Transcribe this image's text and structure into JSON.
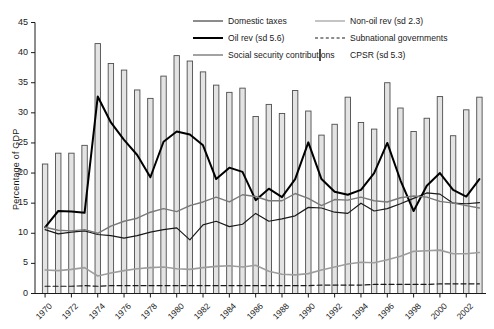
{
  "chart_data": {
    "type": "line",
    "title": "",
    "xlabel": "",
    "ylabel": "Percentage of GDP",
    "ylim": [
      0,
      45
    ],
    "yticks": [
      0,
      5,
      10,
      15,
      20,
      25,
      30,
      35,
      40,
      45
    ],
    "grid": false,
    "legend_position": "top-center",
    "x": [
      1970,
      1971,
      1972,
      1973,
      1974,
      1975,
      1976,
      1977,
      1978,
      1979,
      1980,
      1981,
      1982,
      1983,
      1984,
      1985,
      1986,
      1987,
      1988,
      1989,
      1990,
      1991,
      1992,
      1993,
      1994,
      1995,
      1996,
      1997,
      1998,
      1999,
      2000,
      2001,
      2002,
      2003
    ],
    "xtick_labels": [
      "1970",
      "1972",
      "1974",
      "1976",
      "1978",
      "1980",
      "1982",
      "1984",
      "1986",
      "1988",
      "1990",
      "1992",
      "1994",
      "1996",
      "1998",
      "2000",
      "2002"
    ],
    "series": [
      {
        "name": "CPSR (sd 5.3)",
        "type": "bar",
        "color": "#e3e3e3",
        "edge_color": "#4d4d4d",
        "values": [
          21.5,
          23.3,
          23.3,
          24.6,
          41.5,
          38.2,
          37.1,
          33.8,
          32.4,
          36.1,
          39.5,
          38.6,
          36.8,
          34.6,
          33.4,
          34.1,
          29.4,
          31.4,
          29.9,
          33.7,
          30.3,
          26.3,
          28.1,
          32.6,
          28.4,
          27.3,
          35.0,
          30.8,
          26.9,
          29.1,
          32.7,
          26.2,
          30.5,
          32.6
        ]
      },
      {
        "name": "Domestic taxes",
        "type": "line",
        "color": "#1a1a1a",
        "width": 1.2,
        "values": [
          10.6,
          9.9,
          10.2,
          10.4,
          9.8,
          9.6,
          9.2,
          9.6,
          10.2,
          10.6,
          10.9,
          8.9,
          11.4,
          12.0,
          11.1,
          11.5,
          13.3,
          12.0,
          12.4,
          12.9,
          14.3,
          14.2,
          13.5,
          13.3,
          15.0,
          13.7,
          14.1,
          14.9,
          15.8,
          16.7,
          16.5,
          15.0,
          14.9,
          15.1
        ]
      },
      {
        "name": "Oil rev (sd 5.6)",
        "type": "line",
        "color": "#000000",
        "width": 2.0,
        "values": [
          11.0,
          13.7,
          13.6,
          13.4,
          32.7,
          28.4,
          25.5,
          23.0,
          19.3,
          25.2,
          26.9,
          26.4,
          24.6,
          19.0,
          20.9,
          20.2,
          15.5,
          17.4,
          16.0,
          19.0,
          25.1,
          19.0,
          16.9,
          16.4,
          17.2,
          20.0,
          25.0,
          18.8,
          13.7,
          17.9,
          20.0,
          17.2,
          16.1,
          19.0
        ]
      },
      {
        "name": "Non-oil rev (sd 2.3)",
        "type": "line",
        "color": "#7a7a7a",
        "width": 1.4,
        "values": [
          11.0,
          10.5,
          10.4,
          10.6,
          10.0,
          11.2,
          12.0,
          12.5,
          13.5,
          14.1,
          13.6,
          14.6,
          15.2,
          16.0,
          15.2,
          16.4,
          16.1,
          15.4,
          15.4,
          16.6,
          15.8,
          14.6,
          15.6,
          15.5,
          16.0,
          15.4,
          15.2,
          15.9,
          16.2,
          16.0,
          15.3,
          15.0,
          14.6,
          14.2
        ]
      },
      {
        "name": "Social security contributions",
        "type": "line",
        "color": "#9e9e9e",
        "width": 1.6,
        "values": [
          3.9,
          3.8,
          4.0,
          4.3,
          2.9,
          3.4,
          3.8,
          4.1,
          4.3,
          4.4,
          4.1,
          4.0,
          4.3,
          4.5,
          4.6,
          4.4,
          4.7,
          3.7,
          3.2,
          3.1,
          3.3,
          3.9,
          4.4,
          4.9,
          5.2,
          5.1,
          5.6,
          6.2,
          7.0,
          7.1,
          7.2,
          6.6,
          6.6,
          6.8
        ]
      },
      {
        "name": "Subnational governments",
        "type": "line",
        "color": "#1a1a1a",
        "width": 1.2,
        "dash": "5,3",
        "values": [
          1.2,
          1.2,
          1.2,
          1.3,
          1.2,
          1.3,
          1.3,
          1.3,
          1.3,
          1.3,
          1.3,
          1.3,
          1.3,
          1.3,
          1.3,
          1.3,
          1.3,
          1.3,
          1.3,
          1.3,
          1.3,
          1.4,
          1.4,
          1.4,
          1.4,
          1.5,
          1.5,
          1.5,
          1.5,
          1.5,
          1.6,
          1.6,
          1.6,
          1.6
        ]
      }
    ]
  },
  "legend": {
    "items": [
      {
        "label": "Domestic taxes",
        "swatch": "thin-dark-line"
      },
      {
        "label": "Non-oil rev (sd 2.3)",
        "swatch": "gray-line"
      },
      {
        "label": "Oil rev (sd 5.6)",
        "swatch": "thick-black-line"
      },
      {
        "label": "Subnational governments",
        "swatch": "dashed-line"
      },
      {
        "label": "Social security contributions",
        "swatch": "light-gray-line"
      },
      {
        "label": "CPSR (sd 5.3)",
        "swatch": "gray-box"
      }
    ]
  },
  "colors": {
    "domestic_taxes": "#1a1a1a",
    "oil_rev": "#000000",
    "non_oil_rev": "#7a7a7a",
    "social_security": "#9e9e9e",
    "subnational": "#1a1a1a",
    "cpsr_fill": "#e3e3e3",
    "cpsr_edge": "#4d4d4d",
    "axis": "#1a1a1a"
  }
}
